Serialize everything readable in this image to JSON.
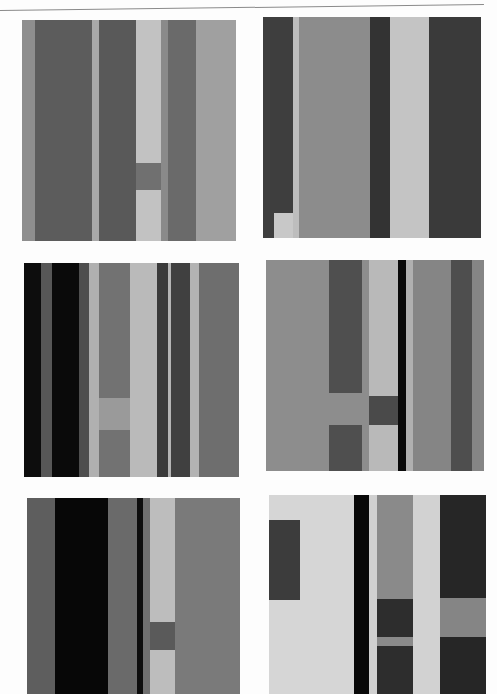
{
  "page": {
    "rule_color": "#8a8a8a"
  },
  "palette": {
    "black": "#0d0d0d",
    "dark": "#4a4a4a",
    "darker": "#2c2c2c",
    "middark": "#5e5e5e",
    "mid": "#7b7b7b",
    "midlight": "#8f8f8f",
    "light": "#b9b9b9",
    "lighter": "#d4d4d4",
    "paper": "#e6e6e6"
  },
  "panels": [
    {
      "id": "panel-1",
      "x": 22,
      "y": 20,
      "w": 214,
      "h": 221,
      "rects": [
        {
          "x": 0,
          "y": 0,
          "w": 214,
          "h": 221,
          "c": "#9a9a9a"
        },
        {
          "x": 0,
          "y": 0,
          "w": 13,
          "h": 221,
          "c": "#8e8e8e"
        },
        {
          "x": 13,
          "y": 0,
          "w": 57,
          "h": 221,
          "c": "#5c5c5c"
        },
        {
          "x": 70,
          "y": 0,
          "w": 7,
          "h": 221,
          "c": "#a8a8a8"
        },
        {
          "x": 77,
          "y": 0,
          "w": 37,
          "h": 221,
          "c": "#595959"
        },
        {
          "x": 114,
          "y": 0,
          "w": 25,
          "h": 221,
          "c": "#c2c2c2"
        },
        {
          "x": 114,
          "y": 143,
          "w": 25,
          "h": 27,
          "c": "#707070"
        },
        {
          "x": 139,
          "y": 0,
          "w": 7,
          "h": 221,
          "c": "#8a8a8a"
        },
        {
          "x": 146,
          "y": 0,
          "w": 28,
          "h": 221,
          "c": "#6a6a6a"
        },
        {
          "x": 174,
          "y": 0,
          "w": 40,
          "h": 221,
          "c": "#a0a0a0"
        }
      ]
    },
    {
      "id": "panel-2",
      "x": 263,
      "y": 17,
      "w": 218,
      "h": 221,
      "rects": [
        {
          "x": 0,
          "y": 0,
          "w": 218,
          "h": 221,
          "c": "#8c8c8c"
        },
        {
          "x": 0,
          "y": 0,
          "w": 30,
          "h": 221,
          "c": "#3e3e3e"
        },
        {
          "x": 11,
          "y": 196,
          "w": 19,
          "h": 25,
          "c": "#c8c8c8"
        },
        {
          "x": 30,
          "y": 0,
          "w": 6,
          "h": 221,
          "c": "#bdbdbd"
        },
        {
          "x": 36,
          "y": 0,
          "w": 71,
          "h": 221,
          "c": "#8c8c8c"
        },
        {
          "x": 107,
          "y": 0,
          "w": 20,
          "h": 221,
          "c": "#333333"
        },
        {
          "x": 127,
          "y": 0,
          "w": 39,
          "h": 221,
          "c": "#c4c4c4"
        },
        {
          "x": 166,
          "y": 0,
          "w": 52,
          "h": 221,
          "c": "#3a3a3a"
        }
      ]
    },
    {
      "id": "panel-3",
      "x": 24,
      "y": 263,
      "w": 215,
      "h": 214,
      "rects": [
        {
          "x": 0,
          "y": 0,
          "w": 215,
          "h": 214,
          "c": "#6e6e6e"
        },
        {
          "x": 0,
          "y": 0,
          "w": 17,
          "h": 214,
          "c": "#0d0d0d"
        },
        {
          "x": 17,
          "y": 0,
          "w": 11,
          "h": 214,
          "c": "#575757"
        },
        {
          "x": 28,
          "y": 0,
          "w": 27,
          "h": 214,
          "c": "#0a0a0a"
        },
        {
          "x": 55,
          "y": 0,
          "w": 10,
          "h": 214,
          "c": "#4e4e4e"
        },
        {
          "x": 65,
          "y": 0,
          "w": 10,
          "h": 214,
          "c": "#b0b0b0"
        },
        {
          "x": 75,
          "y": 0,
          "w": 31,
          "h": 214,
          "c": "#727272"
        },
        {
          "x": 75,
          "y": 135,
          "w": 31,
          "h": 32,
          "c": "#9a9a9a"
        },
        {
          "x": 106,
          "y": 0,
          "w": 27,
          "h": 214,
          "c": "#bababa"
        },
        {
          "x": 133,
          "y": 0,
          "w": 11,
          "h": 214,
          "c": "#3a3a3a"
        },
        {
          "x": 144,
          "y": 0,
          "w": 3,
          "h": 214,
          "c": "#b5b5b5"
        },
        {
          "x": 147,
          "y": 0,
          "w": 19,
          "h": 214,
          "c": "#404040"
        },
        {
          "x": 166,
          "y": 0,
          "w": 9,
          "h": 214,
          "c": "#b3b3b3"
        },
        {
          "x": 175,
          "y": 0,
          "w": 40,
          "h": 214,
          "c": "#6e6e6e"
        }
      ]
    },
    {
      "id": "panel-4",
      "x": 266,
      "y": 260,
      "w": 218,
      "h": 211,
      "rects": [
        {
          "x": 0,
          "y": 0,
          "w": 218,
          "h": 211,
          "c": "#8d8d8d"
        },
        {
          "x": 63,
          "y": 0,
          "w": 33,
          "h": 133,
          "c": "#4f4f4f"
        },
        {
          "x": 63,
          "y": 165,
          "w": 33,
          "h": 46,
          "c": "#4f4f4f"
        },
        {
          "x": 96,
          "y": 0,
          "w": 7,
          "h": 211,
          "c": "#8d8d8d"
        },
        {
          "x": 103,
          "y": 0,
          "w": 29,
          "h": 211,
          "c": "#b9b9b9"
        },
        {
          "x": 103,
          "y": 136,
          "w": 29,
          "h": 29,
          "c": "#4a4a4a"
        },
        {
          "x": 132,
          "y": 0,
          "w": 8,
          "h": 211,
          "c": "#0a0a0a"
        },
        {
          "x": 140,
          "y": 0,
          "w": 7,
          "h": 211,
          "c": "#b0b0b0"
        },
        {
          "x": 147,
          "y": 0,
          "w": 38,
          "h": 211,
          "c": "#858585"
        },
        {
          "x": 185,
          "y": 0,
          "w": 21,
          "h": 211,
          "c": "#4e4e4e"
        },
        {
          "x": 206,
          "y": 0,
          "w": 12,
          "h": 211,
          "c": "#858585"
        }
      ]
    },
    {
      "id": "panel-5",
      "x": 27,
      "y": 498,
      "w": 213,
      "h": 196,
      "rects": [
        {
          "x": 0,
          "y": 0,
          "w": 213,
          "h": 196,
          "c": "#6e6e6e"
        },
        {
          "x": 0,
          "y": 0,
          "w": 28,
          "h": 196,
          "c": "#5e5e5e"
        },
        {
          "x": 28,
          "y": 0,
          "w": 53,
          "h": 196,
          "c": "#070707"
        },
        {
          "x": 81,
          "y": 0,
          "w": 29,
          "h": 196,
          "c": "#6a6a6a"
        },
        {
          "x": 110,
          "y": 0,
          "w": 6,
          "h": 196,
          "c": "#0d0d0d"
        },
        {
          "x": 116,
          "y": 0,
          "w": 7,
          "h": 196,
          "c": "#6f6f6f"
        },
        {
          "x": 123,
          "y": 0,
          "w": 25,
          "h": 196,
          "c": "#bdbdbd"
        },
        {
          "x": 123,
          "y": 124,
          "w": 25,
          "h": 28,
          "c": "#5a5a5a"
        },
        {
          "x": 148,
          "y": 0,
          "w": 65,
          "h": 196,
          "c": "#7a7a7a"
        }
      ]
    },
    {
      "id": "panel-6",
      "x": 269,
      "y": 495,
      "w": 217,
      "h": 199,
      "rects": [
        {
          "x": 0,
          "y": 0,
          "w": 217,
          "h": 199,
          "c": "#d6d6d6"
        },
        {
          "x": 0,
          "y": 25,
          "w": 31,
          "h": 80,
          "c": "#3c3c3c"
        },
        {
          "x": 85,
          "y": 0,
          "w": 15,
          "h": 199,
          "c": "#080808"
        },
        {
          "x": 100,
          "y": 0,
          "w": 8,
          "h": 199,
          "c": "#d0d0d0"
        },
        {
          "x": 108,
          "y": 0,
          "w": 36,
          "h": 199,
          "c": "#8a8a8a"
        },
        {
          "x": 108,
          "y": 104,
          "w": 36,
          "h": 38,
          "c": "#2d2d2d"
        },
        {
          "x": 108,
          "y": 151,
          "w": 36,
          "h": 48,
          "c": "#2d2d2d"
        },
        {
          "x": 144,
          "y": 0,
          "w": 27,
          "h": 199,
          "c": "#d2d2d2"
        },
        {
          "x": 171,
          "y": 0,
          "w": 46,
          "h": 199,
          "c": "#262626"
        },
        {
          "x": 171,
          "y": 103,
          "w": 46,
          "h": 39,
          "c": "#858585"
        }
      ]
    }
  ]
}
